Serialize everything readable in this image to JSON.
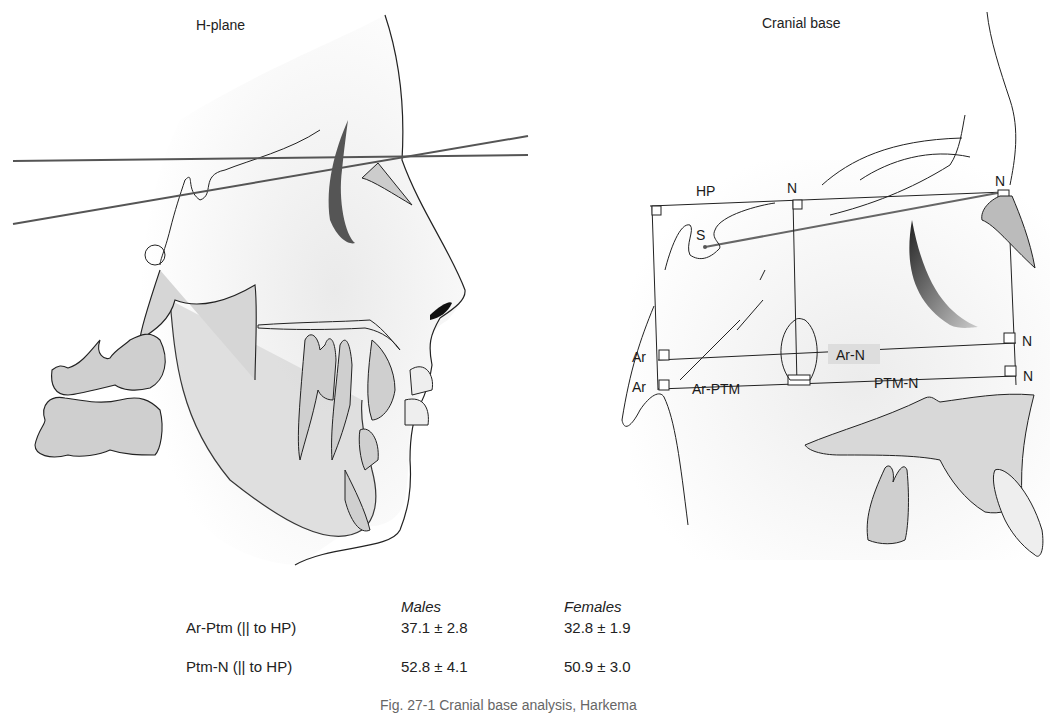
{
  "figure": {
    "left_panel": {
      "title": "H-plane"
    },
    "right_panel": {
      "title": "Cranial base",
      "labels": {
        "hp": "HP",
        "n_top_mid": "N",
        "n_top_right": "N",
        "s": "S",
        "ar_upper": "Ar",
        "ar_lower": "Ar",
        "ar_n": "Ar-N",
        "ar_ptm": "Ar-PTM",
        "ptm_n": "PTM-N",
        "n_mid_right": "N",
        "n_low_right": "N"
      }
    }
  },
  "table": {
    "headers": [
      "",
      "Males",
      "Females"
    ],
    "rows": [
      {
        "measure": "Ar-Ptm (|| to HP)",
        "males": "37.1 ± 2.8",
        "females": "32.8 ± 1.9"
      },
      {
        "measure": "Ptm-N (|| to HP)",
        "males": "52.8 ± 4.1",
        "females": "50.9 ± 3.0"
      }
    ]
  },
  "caption": "Fig. 27-1 Cranial base analysis, Harkema"
}
